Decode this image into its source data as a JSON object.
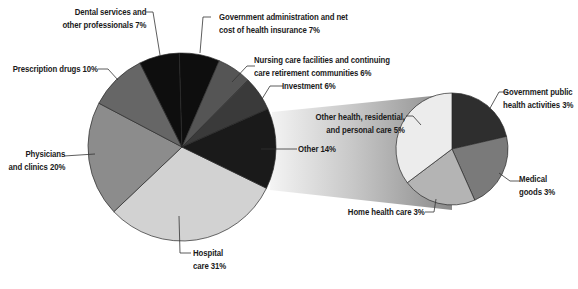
{
  "chart_data": {
    "type": "pie",
    "title": "",
    "main_pie": {
      "slices": [
        {
          "label": "Hospital care",
          "value": 31,
          "color": "#d2d2d2"
        },
        {
          "label": "Physicians and clinics",
          "value": 20,
          "color": "#8c8c8c"
        },
        {
          "label": "Prescription drugs",
          "value": 10,
          "color": "#666666"
        },
        {
          "label": "Dental services and other professionals",
          "value": 7,
          "color": "#0e0e0e"
        },
        {
          "label": "Government administration and net cost of health insurance",
          "value": 7,
          "color": "#0e0e0e"
        },
        {
          "label": "Nursing care facilities and continuing care retirement communities",
          "value": 6,
          "color": "#555555"
        },
        {
          "label": "Investment",
          "value": 6,
          "color": "#3a3a3a"
        },
        {
          "label": "Other",
          "value": 14,
          "color": "#1a1a1a"
        }
      ]
    },
    "breakout_pie": {
      "parent": "Other",
      "slices": [
        {
          "label": "Government public health activities",
          "value": 3,
          "color": "#2e2e2e"
        },
        {
          "label": "Medical goods",
          "value": 3,
          "color": "#7a7a7a"
        },
        {
          "label": "Home health care",
          "value": 3,
          "color": "#b4b4b4"
        },
        {
          "label": "Other health, residential, and personal care",
          "value": 5,
          "color": "#ececec"
        }
      ]
    },
    "unit": "%",
    "legend": "none (callout labels)"
  },
  "labels": {
    "dental": [
      "Dental services and",
      "other professionals 7%"
    ],
    "gov_admin": [
      "Government administration and net",
      "cost of health insurance 7%"
    ],
    "prescription": [
      "Prescription drugs 10%"
    ],
    "nursing": [
      "Nursing care facilities and continuing",
      "care retirement communities 6%"
    ],
    "investment": [
      "Investment 6%"
    ],
    "physicians": [
      "Physicians",
      "and clinics 20%"
    ],
    "other": [
      "Other 14%"
    ],
    "other_health": [
      "Other health, residential,",
      "and personal care 5%"
    ],
    "gov_public": [
      "Government public",
      "health activities 3%"
    ],
    "medical_goods": [
      "Medical",
      "goods 3%"
    ],
    "home_health": [
      "Home health care  3%"
    ],
    "hospital": [
      "Hospital",
      "care 31%"
    ]
  }
}
